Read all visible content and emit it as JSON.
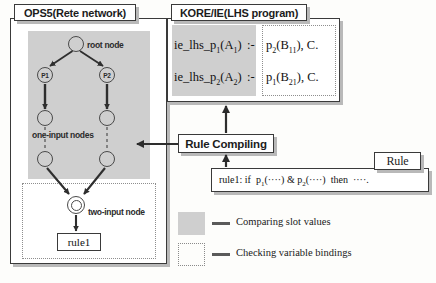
{
  "panels": {
    "ops5": {
      "title": "OPS5(Rete network)",
      "network": {
        "root_label": "root node",
        "one_input_label": "one-input nodes",
        "two_input_label": "two-input node",
        "alpha_nodes": [
          "P1",
          "P2"
        ],
        "terminal_box": "rule1"
      }
    },
    "kore": {
      "title": "KORE/IE(LHS program)",
      "clauses": [
        {
          "head": "ie_lhs_p1(A1)",
          "neck": ":-",
          "body": "p2(B11), C."
        },
        {
          "head": "ie_lhs_p2(A2)",
          "neck": ":-",
          "body": "p1(B21), C."
        }
      ]
    }
  },
  "process": {
    "compiler_label": "Rule Compiling"
  },
  "rule": {
    "tag": "Rule",
    "text_plain": "rule1: if  p1(····) & p2(····)  then  ····.",
    "name": "rule1:",
    "if_kw": "if",
    "cond1": "p1(····)",
    "amp": "&",
    "cond2": "p2(····)",
    "then_kw": "then",
    "action": "····."
  },
  "legend": {
    "items": [
      {
        "swatch": "gray-fill",
        "label": "Comparing slot values"
      },
      {
        "swatch": "dotted-outline",
        "label": "Checking variable bindings"
      }
    ]
  },
  "colors": {
    "gray_region": "#cfcfcf",
    "outline": "#3a3a3a",
    "shadow": "#b9b9b9",
    "dotted": "#8e8e8e"
  }
}
